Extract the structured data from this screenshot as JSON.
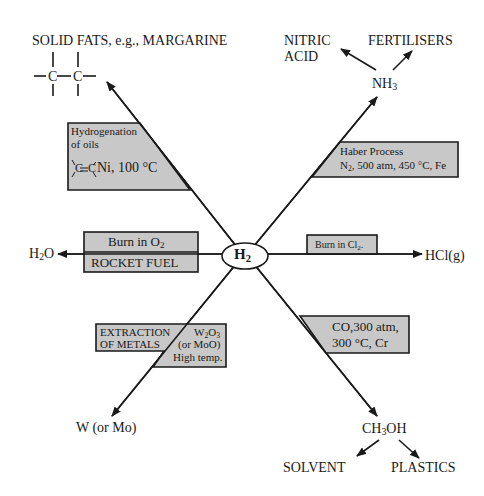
{
  "center": {
    "label": "H",
    "sub": "2"
  },
  "branches": {
    "top_left": {
      "product": "SOLID FATS, e.g., MARGARINE",
      "structure": "C—C",
      "box": {
        "line1": "Hydrogenation",
        "line2": "of oils",
        "line3_pre": "C=C",
        "line3": "Ni, 100 °C"
      }
    },
    "top_right": {
      "product_main": "NH",
      "product_sub": "3",
      "sub_products": [
        "NITRIC",
        "ACID",
        "FERTILISERS"
      ],
      "box": {
        "line1": "Haber Process",
        "line2_pre": "N",
        "line2_sub": "2",
        "line2": ", 500  atm, 450 °C, Fe"
      }
    },
    "left": {
      "product_pre": "H",
      "product_sub": "2",
      "product_post": "O",
      "box": {
        "line1_pre": "Burn in O",
        "line1_sub": "2",
        "line2": "ROCKET FUEL"
      }
    },
    "right": {
      "product": "HCl(g)",
      "box": {
        "line1_pre": "Burn in Cl",
        "line1_sub": "2",
        "line1_post": "."
      }
    },
    "bottom_left": {
      "product": "W (or Mo)",
      "box": {
        "left1": "EXTRACTION",
        "left2": "OF METALS",
        "right1_pre": "W",
        "right1_sub1": "2",
        "right1_mid": "O",
        "right1_sub2": "3",
        "right2": "(or MoO)",
        "right3": "High temp."
      }
    },
    "bottom_right": {
      "product_pre": "CH",
      "product_sub": "3",
      "product_post": "OH",
      "sub_products": [
        "SOLVENT",
        "PLASTICS"
      ],
      "box": {
        "line1": "CO,300  atm,",
        "line2": "300 °C, Cr"
      }
    }
  },
  "colors": {
    "box_fill": "#c8c8c8",
    "line": "#1a1a1a",
    "background": "#ffffff"
  }
}
